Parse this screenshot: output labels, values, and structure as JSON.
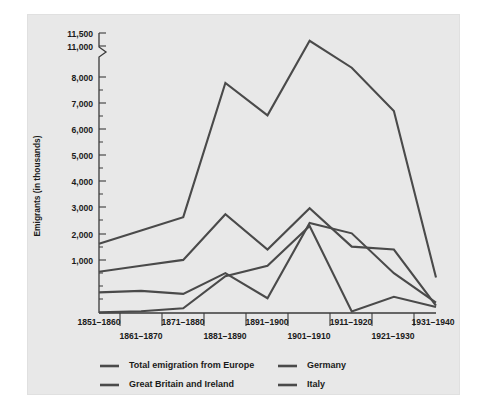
{
  "chart_data": {
    "type": "line",
    "title": "",
    "subtitle": "",
    "xlabel": "",
    "ylabel": "Emigrants (in thousands)",
    "categories": [
      "1851–1860",
      "1861–1870",
      "1871–1880",
      "1881–1890",
      "1891–1900",
      "1901–1910",
      "1911–1920",
      "1921–1930",
      "1931–1940"
    ],
    "ytick_labels": [
      "11,500",
      "11,000",
      "8,000",
      "7,000",
      "6,000",
      "5,000",
      "4,000",
      "3,000",
      "2,000",
      "1,000"
    ],
    "ytick_values": [
      11500,
      11000,
      8000,
      7000,
      6000,
      5000,
      4000,
      3000,
      2000,
      1000
    ],
    "yaxis_break": {
      "present": true,
      "between": [
        8000,
        11000
      ],
      "style": "zigzag"
    },
    "ylim": [
      0,
      11500
    ],
    "grid": false,
    "legend_position": "bottom",
    "series": [
      {
        "name": "Total emigration from Europe",
        "color": "#4a4a4a",
        "values": [
          2350,
          2800,
          3250,
          7800,
          6700,
          11200,
          8900,
          6850,
          1200
        ]
      },
      {
        "name": "Great Britain and Ireland",
        "color": "#4a4a4a",
        "values": [
          1400,
          1600,
          1800,
          3350,
          2150,
          3550,
          2250,
          2150,
          250
        ]
      },
      {
        "name": "Germany",
        "color": "#4a4a4a",
        "values": [
          700,
          750,
          650,
          1350,
          500,
          3050,
          2700,
          1350,
          350
        ]
      },
      {
        "name": "Italy",
        "color": "#4a4a4a",
        "values": [
          20,
          60,
          160,
          1250,
          1600,
          2950,
          50,
          550,
          200
        ]
      }
    ]
  },
  "legend": {
    "entries": [
      {
        "label": "Total emigration from Europe"
      },
      {
        "label": "Germany"
      },
      {
        "label": "Great Britain and Ireland"
      },
      {
        "label": "Italy"
      }
    ]
  },
  "colors": {
    "panel_background": "#e8e8e8",
    "page_background": "#ffffff",
    "line": "#4a4a4a",
    "axis": "#3a3a3a",
    "text": "#1a1a1a"
  }
}
